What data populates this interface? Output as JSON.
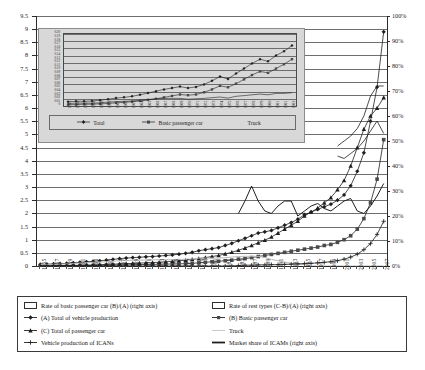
{
  "chart_data": {
    "type": "line",
    "title": "",
    "xlabel": "",
    "ylabel": "",
    "ylim": [
      0,
      9.5
    ],
    "y2lim": [
      0,
      100
    ],
    "y2_unit": "%",
    "grid": true,
    "legend_position": "bottom",
    "x_tick_step": 2,
    "yticks": [
      "0",
      "0.5",
      "1",
      "1.5",
      "2",
      "2.5",
      "3",
      "3.5",
      "4",
      "4.5",
      "5",
      "5.5",
      "6",
      "6.5",
      "7",
      "7.5",
      "8",
      "8.5",
      "9",
      "9.5"
    ],
    "y2ticks": [
      "0%",
      "10%",
      "20%",
      "30%",
      "40%",
      "50%",
      "60%",
      "70%",
      "80%",
      "90%",
      "100%"
    ],
    "x": [
      1955,
      1956,
      1957,
      1958,
      1959,
      1960,
      1961,
      1962,
      1963,
      1964,
      1965,
      1966,
      1967,
      1968,
      1969,
      1970,
      1971,
      1972,
      1973,
      1974,
      1975,
      1976,
      1977,
      1978,
      1979,
      1980,
      1981,
      1982,
      1983,
      1984,
      1985,
      1986,
      1987,
      1988,
      1989,
      1990,
      1991,
      1992,
      1993,
      1994,
      1995,
      1996,
      1997,
      1998,
      1999,
      2000,
      2001,
      2002,
      2003,
      2004,
      2005,
      2006,
      2007
    ],
    "xticklabels": [
      "1955",
      "1957",
      "1959",
      "1961",
      "1963",
      "1965",
      "1967",
      "1969",
      "1971",
      "1973",
      "1975",
      "1977",
      "1979",
      "1981",
      "1983",
      "1985",
      "1987",
      "1989",
      "1991",
      "1993",
      "1995",
      "1997",
      "1999",
      "2001",
      "2003",
      "2005",
      "2007"
    ],
    "series": [
      {
        "name": "(A) Total of vehicle production",
        "key": "total_vehicle",
        "axis": "left",
        "marker": "diamond",
        "values": [
          0.06,
          0.07,
          0.08,
          0.09,
          0.1,
          0.12,
          0.14,
          0.16,
          0.18,
          0.2,
          0.22,
          0.25,
          0.28,
          0.3,
          0.32,
          0.33,
          0.35,
          0.36,
          0.38,
          0.4,
          0.42,
          0.45,
          0.48,
          0.52,
          0.58,
          0.62,
          0.66,
          0.7,
          0.78,
          0.86,
          0.96,
          1.05,
          1.15,
          1.25,
          1.3,
          1.35,
          1.45,
          1.55,
          1.65,
          1.78,
          1.95,
          2.05,
          2.15,
          2.25,
          2.35,
          2.5,
          2.7,
          3.05,
          3.6,
          4.3,
          5.5,
          6.8,
          8.9
        ]
      },
      {
        "name": "(B) Basic passenger car",
        "key": "basic_passenger_car",
        "axis": "left",
        "marker": "square",
        "values": [
          0.0,
          0.0,
          0.0,
          0.01,
          0.01,
          0.01,
          0.01,
          0.02,
          0.02,
          0.02,
          0.03,
          0.03,
          0.04,
          0.04,
          0.05,
          0.05,
          0.06,
          0.06,
          0.07,
          0.07,
          0.08,
          0.08,
          0.09,
          0.1,
          0.12,
          0.14,
          0.16,
          0.18,
          0.2,
          0.22,
          0.26,
          0.28,
          0.32,
          0.36,
          0.4,
          0.44,
          0.48,
          0.52,
          0.56,
          0.6,
          0.64,
          0.68,
          0.72,
          0.78,
          0.82,
          0.9,
          1.0,
          1.15,
          1.4,
          1.8,
          2.4,
          3.3,
          4.8
        ]
      },
      {
        "name": "(C) Total of passenger car",
        "key": "total_passenger_car",
        "axis": "left",
        "marker": "triangle",
        "values": [
          0.01,
          0.01,
          0.01,
          0.02,
          0.02,
          0.02,
          0.03,
          0.03,
          0.04,
          0.05,
          0.06,
          0.07,
          0.08,
          0.09,
          0.1,
          0.11,
          0.12,
          0.13,
          0.14,
          0.16,
          0.18,
          0.2,
          0.22,
          0.25,
          0.28,
          0.32,
          0.36,
          0.4,
          0.46,
          0.52,
          0.6,
          0.68,
          0.78,
          0.88,
          0.98,
          1.1,
          1.25,
          1.4,
          1.55,
          1.7,
          1.9,
          2.05,
          2.2,
          2.4,
          2.6,
          2.9,
          3.25,
          3.8,
          4.5,
          5.2,
          5.7,
          6.0,
          6.4
        ]
      },
      {
        "name": "Truck",
        "key": "truck",
        "axis": "left",
        "marker": "none",
        "values": [
          0.05,
          0.06,
          0.07,
          0.07,
          0.08,
          0.1,
          0.11,
          0.13,
          0.14,
          0.15,
          0.16,
          0.18,
          0.2,
          0.21,
          0.22,
          0.22,
          0.23,
          0.23,
          0.24,
          0.24,
          0.24,
          0.25,
          0.26,
          0.27,
          0.3,
          0.3,
          0.3,
          0.3,
          0.32,
          0.34,
          0.36,
          0.37,
          0.37,
          0.37,
          0.32,
          0.25,
          0.2,
          0.15,
          0.1,
          0.08,
          0.05,
          0.0,
          0.0,
          0.0,
          0.0,
          0.0,
          0.0,
          0.0,
          0.0,
          0.0,
          0.0,
          0.0,
          0.0
        ]
      },
      {
        "name": "Vehicle production of ICANs",
        "key": "ican_production",
        "axis": "left",
        "marker": "plus",
        "values": [
          0.0,
          0.0,
          0.0,
          0.0,
          0.0,
          0.0,
          0.0,
          0.0,
          0.0,
          0.0,
          0.0,
          0.0,
          0.0,
          0.0,
          0.0,
          0.0,
          0.0,
          0.0,
          0.0,
          0.0,
          0.0,
          0.0,
          0.0,
          0.0,
          0.0,
          0.0,
          0.0,
          0.0,
          0.0,
          0.0,
          0.02,
          0.03,
          0.03,
          0.04,
          0.04,
          0.05,
          0.05,
          0.06,
          0.07,
          0.08,
          0.09,
          0.1,
          0.12,
          0.14,
          0.16,
          0.2,
          0.26,
          0.34,
          0.45,
          0.62,
          0.85,
          1.2,
          1.7
        ]
      },
      {
        "name": "Market share of ICAMs (right axis)",
        "key": "ican_market_share",
        "axis": "right",
        "marker": "none",
        "values": [
          null,
          null,
          null,
          null,
          null,
          null,
          null,
          null,
          null,
          null,
          null,
          null,
          null,
          null,
          null,
          null,
          null,
          null,
          null,
          null,
          null,
          null,
          null,
          null,
          null,
          null,
          null,
          null,
          null,
          null,
          21.0,
          26.0,
          32.0,
          26.0,
          22.0,
          21.0,
          24.0,
          26.0,
          26.0,
          20.0,
          22.0,
          24.0,
          25.0,
          23.0,
          22.0,
          24.0,
          26.0,
          27.0,
          22.0,
          21.0,
          24.0,
          28.0,
          33.0
        ]
      },
      {
        "name": "Rate of basic passenger car (B)/(A) (right axis)",
        "key": "rate_basic_passenger_car",
        "axis": "right",
        "marker": "none",
        "values": [
          null,
          null,
          null,
          null,
          null,
          null,
          null,
          null,
          null,
          null,
          null,
          null,
          null,
          null,
          null,
          null,
          null,
          null,
          null,
          null,
          null,
          null,
          null,
          null,
          null,
          null,
          null,
          null,
          null,
          null,
          null,
          null,
          null,
          null,
          null,
          null,
          null,
          null,
          null,
          null,
          null,
          null,
          null,
          null,
          null,
          48.0,
          50.0,
          52.0,
          55.0,
          60.0,
          68.0,
          72.0,
          72.0
        ]
      },
      {
        "name": "Rate of rest types (C-B)/(A) (right axis)",
        "key": "rate_rest_types",
        "axis": "right",
        "marker": "none",
        "values": [
          null,
          null,
          null,
          null,
          null,
          null,
          null,
          null,
          null,
          null,
          null,
          null,
          null,
          null,
          null,
          null,
          null,
          null,
          null,
          null,
          null,
          null,
          null,
          null,
          null,
          null,
          null,
          null,
          null,
          null,
          null,
          null,
          null,
          null,
          null,
          null,
          null,
          null,
          null,
          null,
          null,
          null,
          null,
          null,
          null,
          44.0,
          43.0,
          45.0,
          47.0,
          50.0,
          54.0,
          58.0,
          53.0
        ]
      }
    ]
  },
  "inset": {
    "ylim": [
      0,
      0.2
    ],
    "yticks": [
      "0.20",
      "0.19",
      "0.18",
      "0.17",
      "0.16",
      "0.15",
      "0.14",
      "0.13",
      "0.12",
      "0.11",
      "0.10",
      "0.09",
      "0.08",
      "0.07",
      "0.06",
      "0.05",
      "0.04",
      "0.03",
      "0.02",
      "0.01",
      "0"
    ],
    "x_start": 1955,
    "x_end": 1983,
    "xticklabels": [
      "1955",
      "1956",
      "1957",
      "1958",
      "1959",
      "1960",
      "1961",
      "1962",
      "1963",
      "1964",
      "1965",
      "1966",
      "1967",
      "1968",
      "1969",
      "1970",
      "1971",
      "1972",
      "1973",
      "1974",
      "1975",
      "1976",
      "1977",
      "1978",
      "1979",
      "1980",
      "1981",
      "1982",
      "1983"
    ],
    "legend": [
      {
        "label": "Total",
        "marker": "diamond"
      },
      {
        "label": "Basic passenger car",
        "marker": "square"
      },
      {
        "label": "Truck",
        "marker": "none"
      }
    ],
    "series": [
      {
        "name": "Total",
        "marker": "diamond",
        "values": [
          0.012,
          0.013,
          0.013,
          0.014,
          0.016,
          0.019,
          0.022,
          0.024,
          0.027,
          0.031,
          0.036,
          0.041,
          0.046,
          0.05,
          0.054,
          0.05,
          0.053,
          0.06,
          0.07,
          0.082,
          0.075,
          0.09,
          0.104,
          0.118,
          0.13,
          0.124,
          0.14,
          0.152,
          0.168
        ]
      },
      {
        "name": "Basic passenger car",
        "marker": "square",
        "values": [
          0.004,
          0.004,
          0.005,
          0.005,
          0.006,
          0.007,
          0.009,
          0.01,
          0.012,
          0.014,
          0.017,
          0.02,
          0.024,
          0.028,
          0.032,
          0.03,
          0.032,
          0.038,
          0.046,
          0.056,
          0.052,
          0.062,
          0.074,
          0.086,
          0.096,
          0.092,
          0.104,
          0.116,
          0.13
        ]
      },
      {
        "name": "Truck",
        "marker": "none",
        "values": [
          0.007,
          0.008,
          0.008,
          0.008,
          0.009,
          0.011,
          0.012,
          0.013,
          0.014,
          0.016,
          0.018,
          0.02,
          0.021,
          0.021,
          0.021,
          0.019,
          0.02,
          0.021,
          0.023,
          0.025,
          0.022,
          0.027,
          0.029,
          0.031,
          0.033,
          0.031,
          0.035,
          0.035,
          0.037
        ]
      }
    ]
  },
  "legend": {
    "items": [
      {
        "label": "Rate of basic passenger car (B)/(A) (right axis)",
        "style": "box",
        "name": "rate-basic-passenger-car"
      },
      {
        "label": "Rate of rest types (C-B)/(A) (right axis)",
        "style": "box",
        "name": "rate-rest-types"
      },
      {
        "label": "(A) Total of vehicle production",
        "style": "diamond",
        "name": "total-vehicle-production"
      },
      {
        "label": "(B) Basic passenger car",
        "style": "square",
        "name": "basic-passenger-car"
      },
      {
        "label": "(C) Total of passenger car",
        "style": "triangle",
        "name": "total-passenger-car"
      },
      {
        "label": "Truck",
        "style": "faint",
        "name": "truck"
      },
      {
        "label": "Vehicle production of ICANs",
        "style": "plus",
        "name": "ican-vehicle-production"
      },
      {
        "label": "Market share of ICAMs (right axis)",
        "style": "thick",
        "name": "ican-market-share"
      }
    ]
  },
  "colors": {
    "line": "#1f1f1f",
    "grid": "#6e6e6e",
    "inset_bg": "#d8d8d8",
    "faint": "#b9b9b9"
  }
}
